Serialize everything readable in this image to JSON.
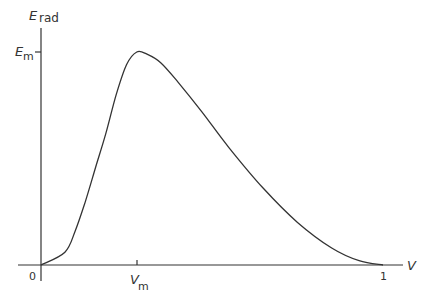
{
  "chart_data": {
    "type": "line",
    "title": "",
    "xlabel": "V",
    "ylabel": "E_rad",
    "ylabel_main": "E",
    "ylabel_sub": "rad",
    "x_ticks": [
      {
        "value": 0,
        "label": "0"
      },
      {
        "value": 0.28,
        "label_main": "V",
        "label_sub": "m"
      },
      {
        "value": 1,
        "label": "1"
      }
    ],
    "y_ticks": [
      {
        "value": 1,
        "label_main": "E",
        "label_sub": "m"
      }
    ],
    "xlim": [
      0,
      1
    ],
    "ylim": [
      0,
      1.05
    ],
    "grid": false,
    "legend": null,
    "series": [
      {
        "name": "E_rad(V)",
        "x": [
          0,
          0.07,
          0.1,
          0.13,
          0.16,
          0.19,
          0.22,
          0.25,
          0.28,
          0.31,
          0.35,
          0.4,
          0.47,
          0.55,
          0.65,
          0.75,
          0.85,
          0.93,
          1.0
        ],
        "y": [
          0,
          0.06,
          0.16,
          0.3,
          0.46,
          0.62,
          0.8,
          0.94,
          1.0,
          0.99,
          0.95,
          0.86,
          0.72,
          0.55,
          0.36,
          0.2,
          0.08,
          0.02,
          0
        ]
      }
    ],
    "annotations": [
      {
        "text": "E_m",
        "at": "y-axis tick at peak height"
      },
      {
        "text": "V_m",
        "at": "x-axis tick at peak position"
      }
    ]
  }
}
